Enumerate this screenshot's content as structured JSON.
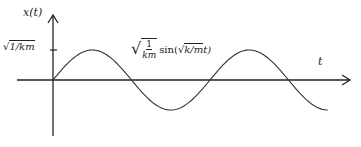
{
  "chart_data": {
    "type": "line",
    "title": "",
    "xlabel": "t",
    "ylabel": "x(t)",
    "y_tick_labels": [
      "√1/km"
    ],
    "annotation": "√(1/km) sin(√(k/m) t)",
    "function": "x(t) = sqrt(1/km) * sin(sqrt(k/m) * t)",
    "amplitude_label": "√1/km",
    "grid": false,
    "legend": null,
    "series": [
      {
        "name": "x(t)",
        "x": [
          0,
          0.5,
          1.0,
          1.5,
          2.0,
          2.5,
          3.0,
          3.5,
          4.0
        ],
        "values": [
          0,
          1,
          0,
          -1,
          0,
          1,
          0,
          -1,
          -1
        ],
        "x_units": "pi / sqrt(k/m)",
        "y_units": "sqrt(1/km)"
      }
    ],
    "x_range_periods": [
      0,
      1.75
    ],
    "ylim": [
      -1.9,
      2.2
    ]
  },
  "labels": {
    "y_axis": "x(t)",
    "x_axis": "t",
    "tick_sqrt": "√",
    "tick_radicand": "1/km",
    "curve_sqrt": "√",
    "curve_num": "1",
    "curve_den": "km",
    "curve_fn": "sin(",
    "curve_inner_sqrt": "√",
    "curve_inner_radicand": "k/m",
    "curve_inner_var": " t)"
  },
  "colors": {
    "axis": "#222222",
    "curve": "#333333",
    "background": "#ffffff"
  }
}
